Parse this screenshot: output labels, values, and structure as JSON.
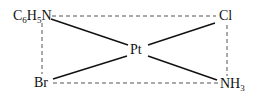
{
  "diagram": {
    "type": "square-planar coordination complex",
    "center_atom": "Pt",
    "ligands": {
      "top_left": {
        "main": "C",
        "sub1": "6",
        "mid": "H",
        "sub2": "5",
        "end": "N"
      },
      "top_right": {
        "main": "Cl"
      },
      "bottom_left": {
        "main": "Br"
      },
      "bottom_right": {
        "main": "NH",
        "sub": "3"
      }
    },
    "bonds": [
      {
        "from": "C6H5N",
        "to": "Pt",
        "style": "solid"
      },
      {
        "from": "Pt",
        "to": "Cl",
        "style": "solid"
      },
      {
        "from": "Br",
        "to": "Pt",
        "style": "solid"
      },
      {
        "from": "Pt",
        "to": "NH3",
        "style": "solid"
      }
    ],
    "outline": {
      "style": "dashed",
      "shape": "rectangle"
    },
    "colors": {
      "ink": "#111111",
      "dash": "#555555",
      "background": "#ffffff"
    }
  }
}
